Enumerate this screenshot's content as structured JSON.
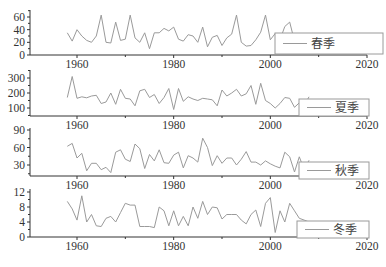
{
  "chart_data": [
    {
      "type": "line",
      "title": "",
      "legend": [
        "春季"
      ],
      "legend_position": "lower right",
      "xlabel": "",
      "ylabel": "",
      "xlim": [
        1950,
        2020
      ],
      "ylim": [
        0,
        70
      ],
      "xticks": [
        1960,
        1980,
        2000,
        2020
      ],
      "yticks": [
        0,
        20,
        40,
        60
      ],
      "grid": false,
      "series": [
        {
          "name": "春季",
          "x_start": 1958,
          "values": [
            35,
            22,
            40,
            30,
            23,
            20,
            30,
            63,
            20,
            19,
            52,
            23,
            25,
            63,
            27,
            20,
            35,
            10,
            35,
            35,
            42,
            38,
            44,
            25,
            22,
            32,
            30,
            20,
            44,
            13,
            28,
            31,
            15,
            27,
            33,
            63,
            20,
            14,
            15,
            24,
            36,
            63,
            24,
            34,
            24,
            45,
            52,
            22,
            28,
            17,
            33
          ]
        }
      ]
    },
    {
      "type": "line",
      "title": "",
      "legend": [
        "夏季"
      ],
      "legend_position": "lower right",
      "xlabel": "",
      "ylabel": "",
      "xlim": [
        1950,
        2020
      ],
      "ylim": [
        50,
        350
      ],
      "xticks": [
        1960,
        1980,
        2000,
        2020
      ],
      "yticks": [
        100,
        200,
        300
      ],
      "grid": false,
      "series": [
        {
          "name": "夏季",
          "x_start": 1958,
          "values": [
            170,
            310,
            165,
            175,
            168,
            180,
            185,
            130,
            140,
            200,
            125,
            225,
            165,
            160,
            115,
            215,
            225,
            170,
            190,
            130,
            170,
            230,
            90,
            230,
            145,
            175,
            160,
            150,
            165,
            160,
            155,
            115,
            220,
            180,
            200,
            225,
            180,
            195,
            250,
            125,
            265,
            150,
            130,
            100,
            130,
            170,
            165,
            105,
            135,
            115,
            175
          ]
        }
      ]
    },
    {
      "type": "line",
      "title": "",
      "legend": [
        "秋季"
      ],
      "legend_position": "lower right",
      "xlabel": "",
      "ylabel": "",
      "xlim": [
        1950,
        2020
      ],
      "ylim": [
        10,
        95
      ],
      "xticks": [
        1960,
        1980,
        2000,
        2020
      ],
      "yticks": [
        30,
        60,
        90
      ],
      "grid": false,
      "series": [
        {
          "name": "秋季",
          "x_start": 1958,
          "values": [
            62,
            67,
            42,
            50,
            20,
            33,
            33,
            22,
            26,
            17,
            52,
            56,
            40,
            36,
            66,
            58,
            24,
            48,
            37,
            56,
            34,
            33,
            47,
            52,
            25,
            46,
            42,
            35,
            76,
            60,
            29,
            46,
            33,
            42,
            42,
            30,
            40,
            53,
            35,
            35,
            30,
            37,
            32,
            28,
            25,
            52,
            44,
            18,
            44,
            22,
            38
          ]
        }
      ]
    },
    {
      "type": "line",
      "title": "",
      "legend": [
        "冬季"
      ],
      "legend_position": "lower right",
      "xlabel": "",
      "ylabel": "",
      "xlim": [
        1950,
        2020
      ],
      "ylim": [
        0,
        13
      ],
      "xticks": [
        1960,
        1980,
        2000,
        2020
      ],
      "yticks": [
        0,
        4,
        8,
        12
      ],
      "grid": false,
      "series": [
        {
          "name": "冬季",
          "x_start": 1958,
          "values": [
            9.5,
            7.5,
            4.5,
            11,
            4,
            6,
            3,
            2.8,
            5,
            5.5,
            4,
            6.5,
            9,
            8.5,
            8.5,
            2.8,
            2.8,
            2.8,
            2.5,
            8,
            7,
            3,
            7,
            3,
            5.5,
            3,
            8,
            5,
            9.5,
            6,
            8,
            7.8,
            4.8,
            6,
            6,
            6,
            4.5,
            3.5,
            6,
            7.2,
            2.8,
            9,
            10.5,
            1.2,
            7,
            4,
            9,
            7,
            5,
            4.5,
            4
          ]
        }
      ]
    }
  ],
  "panels": [
    {
      "legend_label": "春季",
      "yticks": [
        "0",
        "20",
        "40",
        "60"
      ],
      "xticks": [
        "1960",
        "1980",
        "2000",
        "2020"
      ]
    },
    {
      "legend_label": "夏季",
      "yticks": [
        "100",
        "200",
        "300"
      ],
      "xticks": [
        "1960",
        "1980",
        "2000",
        "2020"
      ]
    },
    {
      "legend_label": "秋季",
      "yticks": [
        "30",
        "60",
        "90"
      ],
      "xticks": [
        "1960",
        "1980",
        "2000",
        "2020"
      ]
    },
    {
      "legend_label": "冬季",
      "yticks": [
        "0",
        "4",
        "8",
        "12"
      ],
      "xticks": [
        "1960",
        "1980",
        "2000",
        "2020"
      ]
    }
  ],
  "colors": {
    "line": "#9a9a9a",
    "axis": "#333333",
    "legend_border": "#9a9a9a"
  }
}
